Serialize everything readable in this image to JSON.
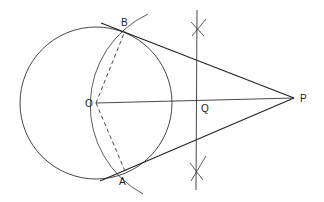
{
  "diagram": {
    "labels": {
      "B": "B",
      "A": "A",
      "O": "O",
      "P": "P",
      "Q": "Q"
    },
    "points": {
      "O": [
        96,
        103
      ],
      "P": [
        294,
        98
      ],
      "Q": [
        197,
        100
      ],
      "B": [
        125,
        31
      ],
      "A": [
        125,
        171
      ]
    },
    "circle": {
      "center": "O",
      "radius": 76
    },
    "construction_arc": {
      "center": "Q",
      "radius": 101
    },
    "colors": {
      "stroke": "#2a2a2a",
      "background": "#ffffff"
    }
  }
}
